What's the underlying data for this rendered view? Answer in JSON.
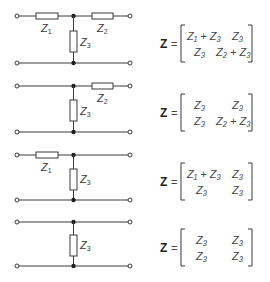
{
  "diagram": {
    "rows": [
      {
        "id": "full-t",
        "circuit": {
          "series_left": "Z1",
          "series_right": "Z2",
          "shunt": "Z3"
        },
        "labels": {
          "z1": "Z",
          "z1_sub": "1",
          "z2": "Z",
          "z2_sub": "2",
          "z3": "Z",
          "z3_sub": "3"
        },
        "matrix": {
          "symbol": "Z",
          "equals": "=",
          "cells": [
            [
              "Z1 + Z3",
              "Z3"
            ],
            [
              "Z3",
              "Z2 + Z3"
            ]
          ]
        }
      },
      {
        "id": "no-z1",
        "circuit": {
          "series_left": null,
          "series_right": "Z2",
          "shunt": "Z3"
        },
        "labels": {
          "z2": "Z",
          "z2_sub": "2",
          "z3": "Z",
          "z3_sub": "3"
        },
        "matrix": {
          "symbol": "Z",
          "equals": "=",
          "cells": [
            [
              "Z3",
              "Z3"
            ],
            [
              "Z3",
              "Z2 + Z3"
            ]
          ]
        }
      },
      {
        "id": "no-z2",
        "circuit": {
          "series_left": "Z1",
          "series_right": null,
          "shunt": "Z3"
        },
        "labels": {
          "z1": "Z",
          "z1_sub": "1",
          "z3": "Z",
          "z3_sub": "3"
        },
        "matrix": {
          "symbol": "Z",
          "equals": "=",
          "cells": [
            [
              "Z1 + Z3",
              "Z3"
            ],
            [
              "Z3",
              "Z3"
            ]
          ]
        }
      },
      {
        "id": "shunt-only",
        "circuit": {
          "series_left": null,
          "series_right": null,
          "shunt": "Z3"
        },
        "labels": {
          "z3": "Z",
          "z3_sub": "3"
        },
        "matrix": {
          "symbol": "Z",
          "equals": "=",
          "cells": [
            [
              "Z3",
              "Z3"
            ],
            [
              "Z3",
              "Z3"
            ]
          ]
        }
      }
    ],
    "colors": {
      "line": "#3a3a3a",
      "node": "#1e1e1e",
      "background": "#ffffff"
    }
  }
}
